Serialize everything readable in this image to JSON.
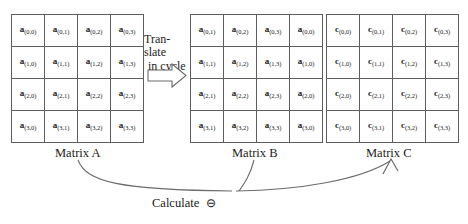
{
  "diagram": {
    "title_present": false,
    "matrices": [
      {
        "id": "A",
        "caption": "Matrix A",
        "symbol": "a",
        "rows": [
          [
            "a(0,0)",
            "a(0,1)",
            "a(0,2)",
            "a(0,3)"
          ],
          [
            "a(1,0)",
            "a(1,1)",
            "a(1,2)",
            "a(1,3)"
          ],
          [
            "a(2,0)",
            "a(2,1)",
            "a(2,2)",
            "a(2,3)"
          ],
          [
            "a(3,0)",
            "a(3,1)",
            "a(3,2)",
            "a(3,3)"
          ]
        ],
        "cells": [
          [
            {
              "sym": "a",
              "sub": "(0,0)"
            },
            {
              "sym": "a",
              "sub": "(0,1)"
            },
            {
              "sym": "a",
              "sub": "(0,2)"
            },
            {
              "sym": "a",
              "sub": "(0,3)"
            }
          ],
          [
            {
              "sym": "a",
              "sub": "(1,0)"
            },
            {
              "sym": "a",
              "sub": "(1,1)"
            },
            {
              "sym": "a",
              "sub": "(1,2)"
            },
            {
              "sym": "a",
              "sub": "(1,3)"
            }
          ],
          [
            {
              "sym": "a",
              "sub": "(2,0)"
            },
            {
              "sym": "a",
              "sub": "(2,1)"
            },
            {
              "sym": "a",
              "sub": "(2,2)"
            },
            {
              "sym": "a",
              "sub": "(2,3)"
            }
          ],
          [
            {
              "sym": "a",
              "sub": "(3,0)"
            },
            {
              "sym": "a",
              "sub": "(3,1)"
            },
            {
              "sym": "a",
              "sub": "(3,2)"
            },
            {
              "sym": "a",
              "sub": "(3,3)"
            }
          ]
        ]
      },
      {
        "id": "B",
        "caption": "Matrix B",
        "symbol": "a",
        "rows": [
          [
            "a(0,1)",
            "a(0,2)",
            "a(0,3)",
            "a(0,0)"
          ],
          [
            "a(1,1)",
            "a(1,2)",
            "a(1,3)",
            "a(1,0)"
          ],
          [
            "a(2,1)",
            "a(2,2)",
            "a(2,3)",
            "a(2,0)"
          ],
          [
            "a(3,1)",
            "a(3,2)",
            "a(3,3)",
            "a(3,0)"
          ]
        ],
        "cells": [
          [
            {
              "sym": "a",
              "sub": "(0,1)"
            },
            {
              "sym": "a",
              "sub": "(0,2)"
            },
            {
              "sym": "a",
              "sub": "(0,3)"
            },
            {
              "sym": "a",
              "sub": "(0,0)"
            }
          ],
          [
            {
              "sym": "a",
              "sub": "(1,1)"
            },
            {
              "sym": "a",
              "sub": "(1,2)"
            },
            {
              "sym": "a",
              "sub": "(1,3)"
            },
            {
              "sym": "a",
              "sub": "(1,0)"
            }
          ],
          [
            {
              "sym": "a",
              "sub": "(2,1)"
            },
            {
              "sym": "a",
              "sub": "(2,2)"
            },
            {
              "sym": "a",
              "sub": "(2,3)"
            },
            {
              "sym": "a",
              "sub": "(2,0)"
            }
          ],
          [
            {
              "sym": "a",
              "sub": "(3,1)"
            },
            {
              "sym": "a",
              "sub": "(3,2)"
            },
            {
              "sym": "a",
              "sub": "(3,3)"
            },
            {
              "sym": "a",
              "sub": "(3,0)"
            }
          ]
        ]
      },
      {
        "id": "C",
        "caption": "Matrix C",
        "symbol": "c",
        "rows": [
          [
            "c(0,0)",
            "c(0,1)",
            "c(0,2)",
            "c(0,3)"
          ],
          [
            "c(1,0)",
            "c(1,1)",
            "c(1,2)",
            "c(1,3)"
          ],
          [
            "c(2,0)",
            "c(2,1)",
            "c(2,2)",
            "c(2,3)"
          ],
          [
            "c(3,0)",
            "c(3,1)",
            "c(3,2)",
            "c(3,3)"
          ]
        ],
        "cells": [
          [
            {
              "sym": "c",
              "sub": "(0,0)"
            },
            {
              "sym": "c",
              "sub": "(0,1)"
            },
            {
              "sym": "c",
              "sub": "(0,2)"
            },
            {
              "sym": "c",
              "sub": "(0,3)"
            }
          ],
          [
            {
              "sym": "c",
              "sub": "(1,0)"
            },
            {
              "sym": "c",
              "sub": "(1,1)"
            },
            {
              "sym": "c",
              "sub": "(1,2)"
            },
            {
              "sym": "c",
              "sub": "(1,3)"
            }
          ],
          [
            {
              "sym": "c",
              "sub": "(2,0)"
            },
            {
              "sym": "c",
              "sub": "(2,1)"
            },
            {
              "sym": "c",
              "sub": "(2,2)"
            },
            {
              "sym": "c",
              "sub": "(2,3)"
            }
          ],
          [
            {
              "sym": "c",
              "sub": "(3,0)"
            },
            {
              "sym": "c",
              "sub": "(3,1)"
            },
            {
              "sym": "c",
              "sub": "(3,2)"
            },
            {
              "sym": "c",
              "sub": "(3,3)"
            }
          ]
        ]
      }
    ],
    "annotations": {
      "translate_line1": "Tran-slate",
      "translate_line2": "in cycle",
      "calculate_label": "Calculate",
      "calculate_operator": "⊖"
    },
    "colors": {
      "grid_line": "#5d5d5d",
      "text": "#1b1b1b",
      "arrow_stroke": "#6b6b6b",
      "background": "#ffffff"
    }
  }
}
